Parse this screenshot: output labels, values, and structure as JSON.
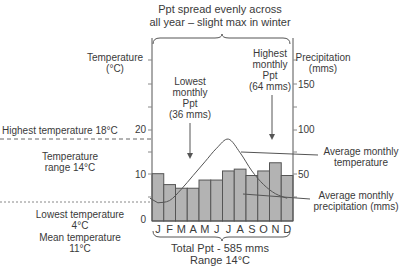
{
  "chart_data": {
    "type": "bar",
    "categories": [
      "J",
      "F",
      "M",
      "A",
      "M",
      "J",
      "J",
      "A",
      "S",
      "O",
      "N",
      "D"
    ],
    "series": [
      {
        "name": "Average monthly precipitation (mms)",
        "type": "bar",
        "axis": "right",
        "values": [
          52,
          40,
          36,
          36,
          45,
          45,
          55,
          57,
          50,
          55,
          64,
          50
        ]
      },
      {
        "name": "Average monthly temperature",
        "type": "line",
        "axis": "left",
        "values": [
          4,
          4.5,
          7,
          10,
          13,
          16,
          18,
          15,
          11,
          8,
          6,
          5
        ]
      }
    ],
    "ylabel_left": "Temperature (°C)",
    "ylabel_right": "Precipitation (mms)",
    "ylim_left": [
      0,
      30
    ],
    "ylim_right": [
      0,
      170
    ],
    "left_ticks": [
      0,
      10,
      20
    ],
    "right_ticks": [
      50,
      100,
      150
    ],
    "xlabel": "Total Ppt - 585 mms Range 14°C",
    "annotations": [
      "Highest temperature 18°C",
      "Temperature range 14°C",
      "Lowest temperature 4°C",
      "Mean temperature 11°C",
      "Lowest monthly Ppt (36 mms)",
      "Highest monthly Ppt (64 mms)",
      "Average monthly temperature",
      "Average monthly precipitation (mms)"
    ],
    "grid": false,
    "colors": {
      "bar": "#b3b3b3",
      "bar_border": "#555555",
      "line": "#555555"
    }
  },
  "labels": {
    "title_line1": "Ppt spread evenly across",
    "title_line2": "all year – slight max in winter",
    "left_axis_1": "Temperature",
    "left_axis_2": "(°C)",
    "right_axis_1": "Precipitation",
    "right_axis_2": "(mms)",
    "lowest_ppt": [
      "Lowest",
      "monthly",
      "Ppt",
      "(36 mms)"
    ],
    "highest_ppt": [
      "Highest",
      "monthly",
      "Ppt",
      "(64 mms)"
    ],
    "highest_temp": "Highest temperature 18°C",
    "temp_range_1": "Temperature",
    "temp_range_2": "range 14°C",
    "lowest_temp_1": "Lowest temperature",
    "lowest_temp_2": "4°C",
    "mean_temp_1": "Mean temperature",
    "mean_temp_2": "11°C",
    "avg_temp_1": "Average monthly",
    "avg_temp_2": "temperature",
    "avg_ppt_1": "Average monthly",
    "avg_ppt_2": "precipitation (mms)",
    "total_ppt": "Total Ppt - 585 mms",
    "range": "Range 14°C",
    "left_ticks": [
      "0",
      "10",
      "20"
    ],
    "right_ticks": [
      "50",
      "100",
      "150"
    ]
  }
}
